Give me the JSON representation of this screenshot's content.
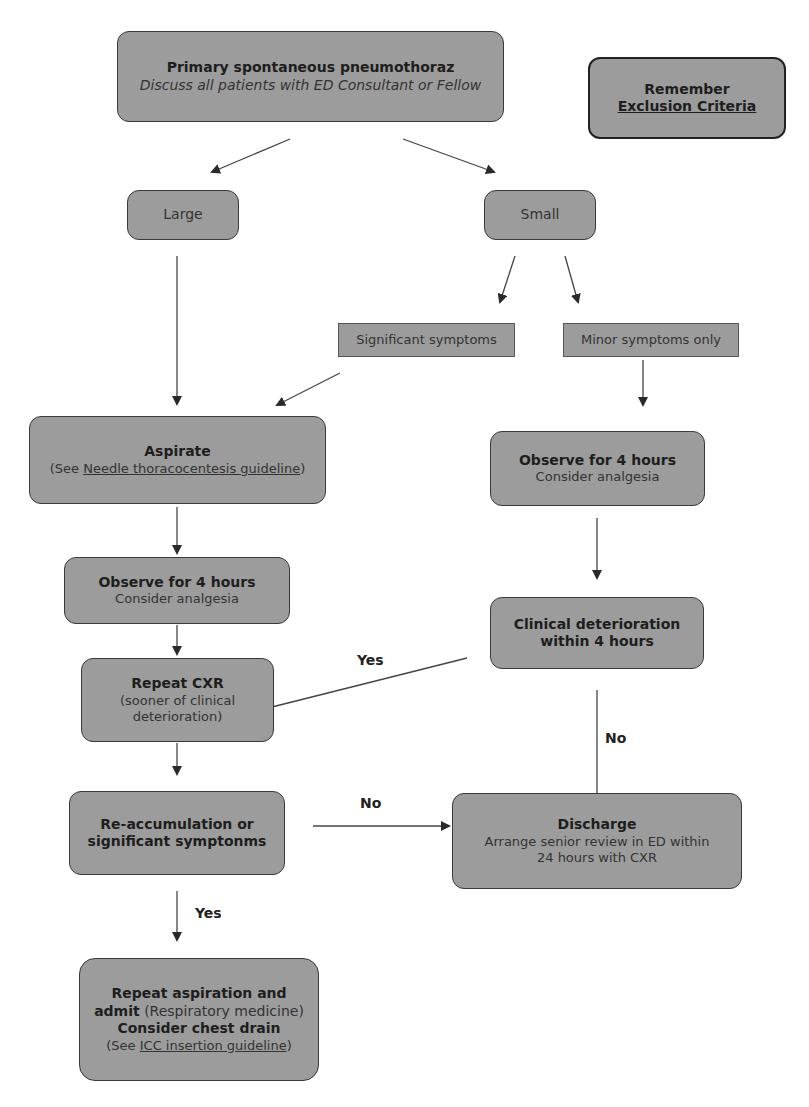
{
  "nodes": {
    "start": {
      "title": "Primary spontaneous pneumothoraz",
      "subtitle": "Discuss all patients with ED Consultant or Fellow"
    },
    "reminder": {
      "prefix": "Remember ",
      "link": "Exclusion Criteria"
    },
    "large": {
      "label": "Large"
    },
    "small": {
      "label": "Small"
    },
    "significant": {
      "label": "Significant symptoms"
    },
    "minor": {
      "label": "Minor symptoms only"
    },
    "aspirate": {
      "title": "Aspirate",
      "pre": "(See ",
      "link": "Needle thoracocentesis guideline",
      "post": ")"
    },
    "observe_right": {
      "title": "Observe for 4 hours",
      "subtitle": "Consider analgesia"
    },
    "observe_left": {
      "title": "Observe for 4 hours",
      "subtitle": "Consider analgesia"
    },
    "deterioration": {
      "line1": "Clinical deterioration",
      "line2": "within 4 hours"
    },
    "repeat_cxr": {
      "title": "Repeat CXR",
      "line1": "(sooner of clinical",
      "line2": "deterioration)"
    },
    "reaccumulation": {
      "line1": "Re-accumulation or",
      "line2": "significant symptonms"
    },
    "discharge": {
      "title": "Discharge",
      "line1": "Arrange senior review in ED within",
      "line2": "24 hours with CXR"
    },
    "admit": {
      "line1": "Repeat aspiration and",
      "bold2": "admit",
      "rest2": " (Respiratory medicine)",
      "line3": "Consider chest drain",
      "pre4": "(See ",
      "link4": "ICC insertion guideline",
      "post4": ")"
    }
  },
  "edge_labels": {
    "yes_deterioration": "Yes",
    "no_deterioration": "No",
    "no_reaccumulation": "No",
    "yes_reaccumulation": "Yes"
  }
}
